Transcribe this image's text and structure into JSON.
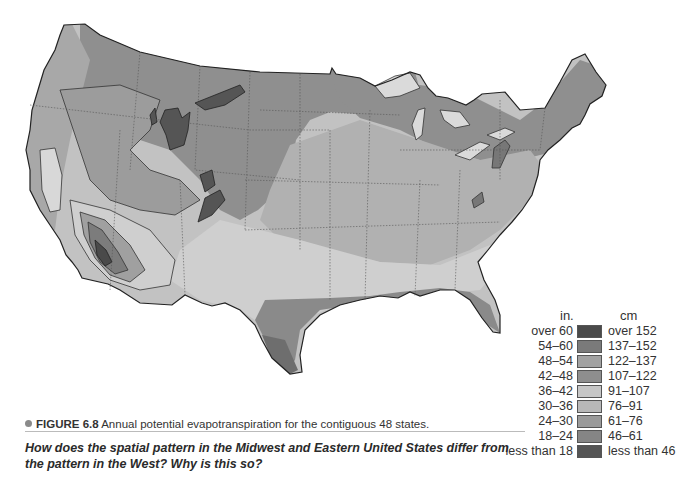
{
  "figure": {
    "number_label": "FIGURE 6.8",
    "caption": "Annual potential evapotranspiration for the contiguous 48 states.",
    "question": "How does the spatial pattern in the Midwest and Eastern United States differ from the pattern in the West? Why is this so?"
  },
  "map": {
    "subject": "Contiguous United States",
    "variable": "Annual potential evapotranspiration"
  },
  "legend": {
    "unit_in": "in.",
    "unit_cm": "cm",
    "classes": [
      {
        "in": "over 60",
        "cm": "over 152",
        "color": "#4a4a4a"
      },
      {
        "in": "54–60",
        "cm": "137–152",
        "color": "#7a7a7a"
      },
      {
        "in": "48–54",
        "cm": "122–137",
        "color": "#a2a2a2"
      },
      {
        "in": "42–48",
        "cm": "107–122",
        "color": "#8e8e8e"
      },
      {
        "in": "36–42",
        "cm": "91–107",
        "color": "#c6c6c6"
      },
      {
        "in": "30–36",
        "cm": "76–91",
        "color": "#b8b8b8"
      },
      {
        "in": "24–30",
        "cm": "61–76",
        "color": "#9a9a9a"
      },
      {
        "in": "18–24",
        "cm": "46–61",
        "color": "#858585"
      },
      {
        "in": "less than 18",
        "cm": "less than 46",
        "color": "#555555"
      }
    ]
  }
}
